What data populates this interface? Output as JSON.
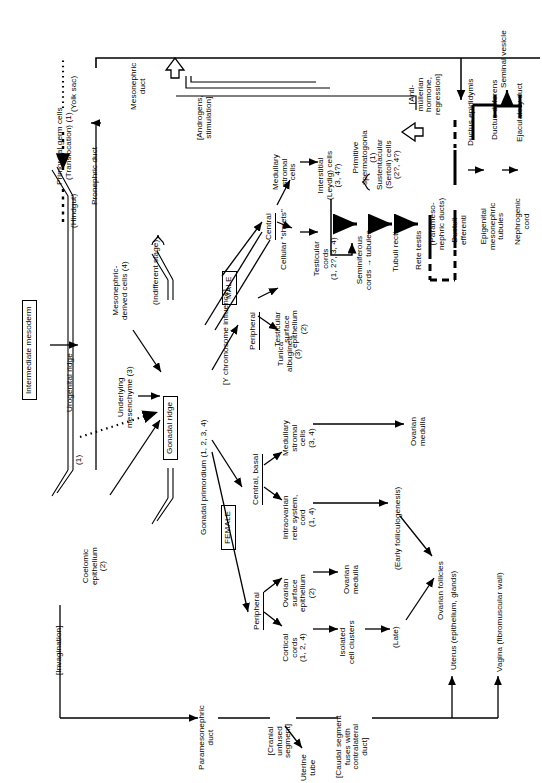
{
  "figure": {
    "type": "flowchart",
    "orientation": "rotated-90-ccw"
  },
  "nodes": {
    "primordial_germ_cells": "Primordial germ cells\n(Translocation) (1)",
    "yolk_sac": "(Yolk sac)",
    "hindgut": "(Hindgut)",
    "pronephric_duct": "Pronephric duct",
    "mesonephric_duct": "Mesonephric\nduct",
    "androgens": "[Androgens,\nstimulation]",
    "intermediate_mesoderm": "Intermediate mesoderm",
    "urogenital_ridge": "Urogenital ridge",
    "underlying_mesenchyme": "Underlying\nmesenchyme (3)",
    "mesonephric_derived_cells": "Mesonephric-\nderived cells (4)",
    "coelomic_epithelium": "Coelomic\nepithelium\n(2)",
    "invagination": "[Invagination]",
    "marker_1": "(1)",
    "gonadal_ridge": "Gonadal ridge",
    "indifferent_stage": "(Indifferent stage)",
    "gonadal_primordium": "Gonadal primordium (1, 2, 3, 4)",
    "y_chromosome": "[Y chromosome influence]",
    "male": "MALE",
    "female": "FEMALE",
    "male_central": "Central",
    "male_peripheral": "Peripheral",
    "female_central_basal": "Central, basal",
    "female_peripheral": "Peripheral",
    "medullary_stromal_cells_m": "Medullary\nstromal\ncells",
    "cellular_sheets": "Cellular \"sheets\"",
    "interstitial_leydig": "Interstitial\n(Leydig) cells\n(3, 4?)",
    "testicular_cords": "Testicular\ncords\n(1, 2?, 3, 4)",
    "seminiferous": "Seminiferous\ncords → tubules",
    "primitive_spermatogonia": "Primitive\nspermatogonia\n(1)",
    "sustentacular": "Sustentacular\n(Sertoli) cells\n(2?, 4?)",
    "tubuli_recti": "Tubuli recti",
    "rete_testis": "Rete testis",
    "paramesonephric_ducts_label": "(Parameso-\nnephric ducts)",
    "anti_mullerian": "[Anti-\nmüllerian\nhormone,\nregression]",
    "ductuli_efferenti": "Ductuli\nefferenti",
    "epigenital_tubules": "Epigenital\nmesonephric\ntubules",
    "nephrogenic_cord": "Nephrogenic\ncord",
    "ductus_epididymis": "Ductus epididymis",
    "ductus_deferens": "Ductus deferens",
    "seminal_vesicle": "Seminal vesicle",
    "ejaculatory_duct": "Ejaculatory duct",
    "tunica_albuginea": "Tunica\nalbuginea\n(3)",
    "testicular_surface_epithelium": "Testicular\nsurface\nepithelium\n(2)",
    "medullary_stromal_cells_f": "Medullary\nstromal\ncells\n(3, 4)",
    "ovarian_medulla_1": "Ovarian\nmedulla",
    "intraovarian_rete": "Intraovarian\nrete system,\ncord\n(1, 4)",
    "early_folliculogenesis": "(Early folliculogenesis)",
    "ovarian_surface_epithelium": "Ovarian\nsurface\nepithelium\n(2)",
    "ovarian_medulla_2": "Ovarian\nmedulla",
    "cortical_cords": "Cortical\ncords\n(1, 2, 4)",
    "isolated_cell_clusters": "Isolated\ncell clusters",
    "late": "(Late)",
    "ovarian_follicles": "Ovarian follicles",
    "paramesonephric_duct": "Paramesonephric\nduct",
    "cranial_unfused": "[Cranial\nunfused\nsegment]",
    "uterine_tube": "Uterine\ntube",
    "caudal_segment": "[Caudal segment\nfuses with\ncontralateral\nduct]",
    "uterus": "Uterus (epithelium, glands)",
    "vagina": "Vagina (fibromuscular wall)"
  },
  "colors": {
    "ink": "#000000",
    "background": "#ffffff"
  }
}
